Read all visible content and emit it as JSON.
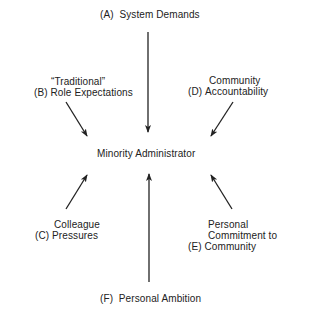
{
  "diagram": {
    "center": {
      "label": "Minority Administrator"
    },
    "forces": [
      {
        "id": "A",
        "tag": "(A)",
        "lines": [
          "System Demands"
        ]
      },
      {
        "id": "B",
        "tag": "(B)",
        "lines": [
          "“Traditional”",
          "Role Expectations"
        ]
      },
      {
        "id": "C",
        "tag": "(C)",
        "lines": [
          "Colleague",
          "Pressures"
        ]
      },
      {
        "id": "D",
        "tag": "(D)",
        "lines": [
          "Community",
          "Accountability"
        ]
      },
      {
        "id": "E",
        "tag": "(E)",
        "lines": [
          "Personal",
          "Commitment to",
          "Community"
        ]
      },
      {
        "id": "F",
        "tag": "(F)",
        "lines": [
          "Personal Ambition"
        ]
      }
    ],
    "colors": {
      "line": "#222222",
      "text": "#222222",
      "background": "#ffffff"
    }
  }
}
